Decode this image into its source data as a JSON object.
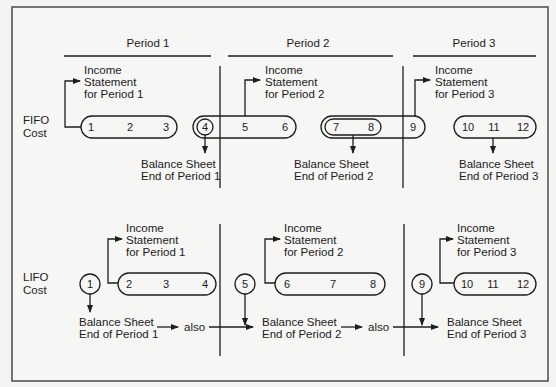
{
  "diagram": {
    "periods": [
      {
        "label": "Period 1"
      },
      {
        "label": "Period 2"
      },
      {
        "label": "Period 3"
      }
    ],
    "fifo": {
      "label_line1": "FIFO",
      "label_line2": "Cost",
      "income_statements": [
        {
          "line1": "Income",
          "line2": "Statement",
          "line3": "for Period 1"
        },
        {
          "line1": "Income",
          "line2": "Statement",
          "line3": "for Period 2"
        },
        {
          "line1": "Income",
          "line2": "Statement",
          "line3": "for Period 3"
        }
      ],
      "balance_sheets": [
        {
          "line1": "Balance Sheet",
          "line2": "End of Period 1"
        },
        {
          "line1": "Balance Sheet",
          "line2": "End of Period 2"
        },
        {
          "line1": "Balance Sheet",
          "line2": "End of Period 3"
        }
      ],
      "units": [
        "1",
        "2",
        "3",
        "4",
        "5",
        "6",
        "7",
        "8",
        "9",
        "10",
        "11",
        "12"
      ]
    },
    "lifo": {
      "label_line1": "LIFO",
      "label_line2": "Cost",
      "income_statements": [
        {
          "line1": "Income",
          "line2": "Statement",
          "line3": "for Period 1"
        },
        {
          "line1": "Income",
          "line2": "Statement",
          "line3": "for Period 2"
        },
        {
          "line1": "Income",
          "line2": "Statement",
          "line3": "for Period 3"
        }
      ],
      "balance_sheets": [
        {
          "line1": "Balance Sheet",
          "line2": "End of Period 1"
        },
        {
          "line1": "Balance Sheet",
          "line2": "End of Period 2"
        },
        {
          "line1": "Balance Sheet",
          "line2": "End of Period 3"
        }
      ],
      "also_labels": [
        "also",
        "also"
      ],
      "units": [
        "1",
        "2",
        "3",
        "4",
        "5",
        "6",
        "7",
        "8",
        "9",
        "10",
        "11",
        "12"
      ]
    }
  }
}
